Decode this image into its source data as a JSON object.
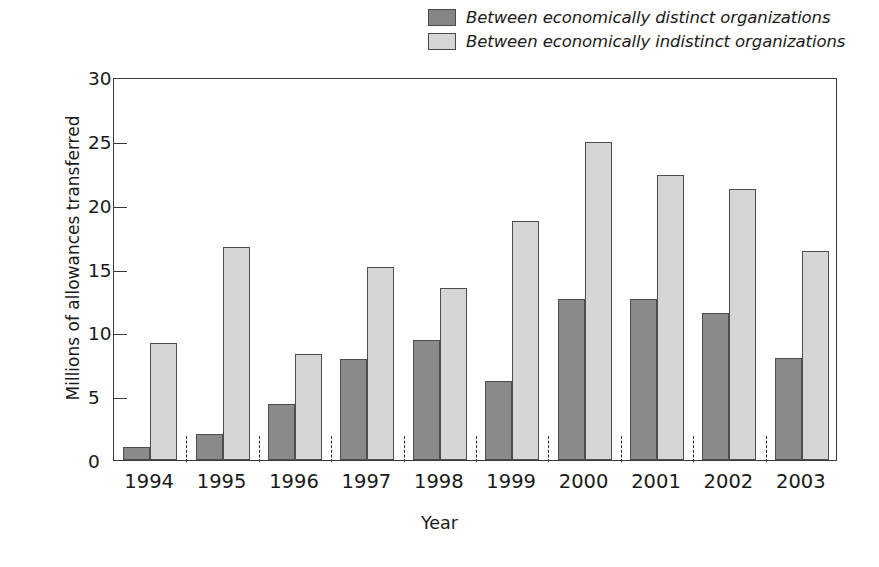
{
  "chart_data": {
    "type": "bar",
    "title": "",
    "xlabel": "Year",
    "ylabel": "Millions of allowances transferred",
    "ylim": [
      0,
      30
    ],
    "yticks": [
      0,
      5,
      10,
      15,
      20,
      25,
      30
    ],
    "ytick_labels": [
      "0",
      "5",
      "10",
      "15",
      "20",
      "25",
      "30"
    ],
    "grid": false,
    "legend_position": "top-right",
    "categories": [
      "1994",
      "1995",
      "1996",
      "1997",
      "1998",
      "1999",
      "2000",
      "2001",
      "2002",
      "2003"
    ],
    "series": [
      {
        "name": "Between economically distinct organizations",
        "color": "#8a8a8a",
        "values": [
          1.0,
          2.0,
          4.4,
          7.9,
          9.4,
          6.2,
          12.6,
          12.6,
          11.5,
          8.0
        ]
      },
      {
        "name": "Between economically indistinct organizations",
        "color": "#d6d6d6",
        "values": [
          9.2,
          16.7,
          8.3,
          15.1,
          13.5,
          18.7,
          24.9,
          22.3,
          21.2,
          16.4
        ]
      }
    ]
  },
  "legend": {
    "items": [
      {
        "label": "Between economically distinct organizations",
        "swatch": "dark"
      },
      {
        "label": "Between economically indistinct organizations",
        "swatch": "light"
      }
    ]
  },
  "axes": {
    "y_title": "Millions of allowances transferred",
    "x_title": "Year"
  }
}
